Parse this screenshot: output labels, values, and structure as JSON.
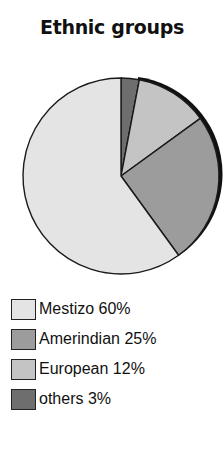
{
  "chart_data": {
    "type": "pie",
    "title": "Ethnic groups",
    "categories": [
      "Mestizo",
      "Amerindian",
      "European",
      "others"
    ],
    "values": [
      60,
      25,
      12,
      3
    ],
    "unit": "%",
    "colors": {
      "Mestizo": "#e4e4e4",
      "Amerindian": "#9c9c9c",
      "European": "#c4c4c4",
      "others": "#6e6e6e"
    },
    "start_angle_deg": 0,
    "direction": "clockwise",
    "slice_order": [
      "others",
      "European",
      "Amerindian",
      "Mestizo"
    ],
    "legend_position": "bottom-left"
  },
  "legend": {
    "items": [
      {
        "label": "Mestizo 60%",
        "color": "#e4e4e4"
      },
      {
        "label": "Amerindian 25%",
        "color": "#9c9c9c"
      },
      {
        "label": "European 12%",
        "color": "#c4c4c4"
      },
      {
        "label": "others 3%",
        "color": "#6e6e6e"
      }
    ]
  }
}
